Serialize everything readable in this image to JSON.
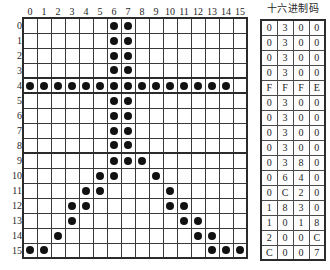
{
  "figure": {
    "grid": {
      "size": 16,
      "column_headers": [
        "0",
        "1",
        "2",
        "3",
        "4",
        "5",
        "6",
        "7",
        "8",
        "9",
        "10",
        "11",
        "12",
        "13",
        "14",
        "15"
      ],
      "row_headers": [
        "0",
        "1",
        "2",
        "3",
        "4",
        "5",
        "6",
        "7",
        "8",
        "9",
        "10",
        "11",
        "12",
        "13",
        "14",
        "15"
      ],
      "dot_color": "#111111",
      "grid_line_color": "#3a3a3a",
      "rows": [
        [
          0,
          0,
          0,
          0,
          0,
          0,
          1,
          1,
          0,
          0,
          0,
          0,
          0,
          0,
          0,
          0
        ],
        [
          0,
          0,
          0,
          0,
          0,
          0,
          1,
          1,
          0,
          0,
          0,
          0,
          0,
          0,
          0,
          0
        ],
        [
          0,
          0,
          0,
          0,
          0,
          0,
          1,
          1,
          0,
          0,
          0,
          0,
          0,
          0,
          0,
          0
        ],
        [
          0,
          0,
          0,
          0,
          0,
          0,
          1,
          1,
          0,
          0,
          0,
          0,
          0,
          0,
          0,
          0
        ],
        [
          1,
          1,
          1,
          1,
          1,
          1,
          1,
          1,
          1,
          1,
          1,
          1,
          1,
          1,
          1,
          0
        ],
        [
          0,
          0,
          0,
          0,
          0,
          0,
          1,
          1,
          0,
          0,
          0,
          0,
          0,
          0,
          0,
          0
        ],
        [
          0,
          0,
          0,
          0,
          0,
          0,
          1,
          1,
          0,
          0,
          0,
          0,
          0,
          0,
          0,
          0
        ],
        [
          0,
          0,
          0,
          0,
          0,
          0,
          1,
          1,
          0,
          0,
          0,
          0,
          0,
          0,
          0,
          0
        ],
        [
          0,
          0,
          0,
          0,
          0,
          0,
          1,
          1,
          0,
          0,
          0,
          0,
          0,
          0,
          0,
          0
        ],
        [
          0,
          0,
          0,
          0,
          0,
          0,
          1,
          1,
          1,
          0,
          0,
          0,
          0,
          0,
          0,
          0
        ],
        [
          0,
          0,
          0,
          0,
          0,
          1,
          1,
          0,
          0,
          1,
          0,
          0,
          0,
          0,
          0,
          0
        ],
        [
          0,
          0,
          0,
          0,
          1,
          1,
          0,
          0,
          0,
          0,
          1,
          0,
          0,
          0,
          0,
          0
        ],
        [
          0,
          0,
          0,
          1,
          1,
          0,
          0,
          0,
          0,
          0,
          1,
          1,
          0,
          0,
          0,
          0
        ],
        [
          0,
          0,
          0,
          1,
          0,
          0,
          0,
          0,
          0,
          0,
          0,
          1,
          1,
          0,
          0,
          0
        ],
        [
          0,
          0,
          1,
          0,
          0,
          0,
          0,
          0,
          0,
          0,
          0,
          0,
          1,
          1,
          0,
          0
        ],
        [
          1,
          1,
          0,
          0,
          0,
          0,
          0,
          0,
          0,
          0,
          0,
          0,
          0,
          1,
          1,
          1
        ]
      ]
    },
    "hex_table": {
      "title": "十六进制码",
      "rows": [
        [
          "0",
          "3",
          "0",
          "0"
        ],
        [
          "0",
          "3",
          "0",
          "0"
        ],
        [
          "0",
          "3",
          "0",
          "0"
        ],
        [
          "0",
          "3",
          "0",
          "0"
        ],
        [
          "F",
          "F",
          "F",
          "E"
        ],
        [
          "0",
          "3",
          "0",
          "0"
        ],
        [
          "0",
          "3",
          "0",
          "0"
        ],
        [
          "0",
          "3",
          "0",
          "0"
        ],
        [
          "0",
          "3",
          "0",
          "0"
        ],
        [
          "0",
          "3",
          "8",
          "0"
        ],
        [
          "0",
          "6",
          "4",
          "0"
        ],
        [
          "0",
          "C",
          "2",
          "0"
        ],
        [
          "1",
          "8",
          "3",
          "0"
        ],
        [
          "1",
          "0",
          "1",
          "8"
        ],
        [
          "2",
          "0",
          "0",
          "C"
        ],
        [
          "C",
          "0",
          "0",
          "7"
        ]
      ]
    }
  }
}
